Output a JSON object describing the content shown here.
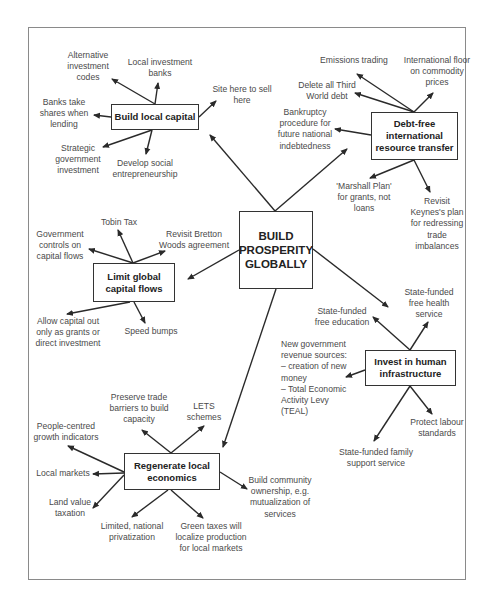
{
  "center": {
    "label": "BUILD\nPROSPERITY\nGLOBALLY"
  },
  "hubs": {
    "local_capital": {
      "label": "Build local capital",
      "leaves": [
        "Alternative\ninvestment\ncodes",
        "Local investment\nbanks",
        "Site here to sell\nhere",
        "Banks take\nshares when\nlending",
        "Strategic\ngovernment\ninvestment",
        "Develop social\nentrepreneurship"
      ]
    },
    "debt_free": {
      "label": "Debt-free\ninternational\nresource transfer",
      "leaves": [
        "Emissions trading",
        "International floor\non commodity\nprices",
        "Delete all Third\nWorld debt",
        "Bankruptcy\nprocedure for\nfuture national\nindebtedness",
        "'Marshall Plan'\nfor grants, not\nloans",
        "Revisit\nKeynes's plan\nfor redressing\ntrade\nimbalances"
      ]
    },
    "capital_flows": {
      "label": "Limit global\ncapital flows",
      "leaves": [
        "Government\ncontrols on\ncapital flows",
        "Tobin Tax",
        "Revisit Bretton\nWoods agreement",
        "Allow capital out\nonly as grants or\ndirect investment",
        "Speed bumps"
      ]
    },
    "human_infra": {
      "label": "Invest in human\ninfrastructure",
      "leaves": [
        "State-funded\nfree education",
        "State-funded\nfree health\nservice",
        "New government\nrevenue sources:\n– creation of new\n   money\n– Total Economic\n   Activity Levy\n   (TEAL)",
        "Protect labour\nstandards",
        "State-funded family\nsupport service"
      ]
    },
    "local_econ": {
      "label": "Regenerate local\neconomics",
      "leaves": [
        "Preserve trade\nbarriers to build\ncapacity",
        "LETS\nschemes",
        "People-centred\ngrowth indicators",
        "Local markets",
        "Land value\ntaxation",
        "Limited, national\nprivatization",
        "Green taxes will\nlocalize production\nfor local markets",
        "Build community\nownership, e.g.\nmutualization of\nservices"
      ]
    }
  },
  "colors": {
    "line": "#2a2a2a",
    "frame": "#8a8a8a",
    "text": "#4a4a4a"
  }
}
